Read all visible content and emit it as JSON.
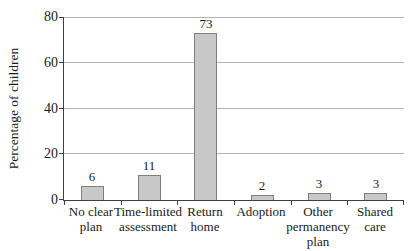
{
  "chart_data": {
    "type": "bar",
    "title": "",
    "xlabel": "",
    "ylabel": "Percentage of children",
    "categories": [
      "No clear\nplan",
      "Time-limited\nassessment",
      "Return\nhome",
      "Adoption",
      "Other\npermanency\nplan",
      "Shared\ncare"
    ],
    "values": [
      6,
      11,
      73,
      2,
      3,
      3
    ],
    "value_labels": [
      "6",
      "11",
      "73",
      "2",
      "3",
      "3"
    ],
    "ylim": [
      0,
      80
    ],
    "yticks": [
      0,
      20,
      40,
      60,
      80
    ],
    "grid": true,
    "legend_position": "none",
    "colors": {
      "bar_fill": "#c8c8c8",
      "bar_border": "#7f7f7f",
      "gridline": "#b3b3b3",
      "axis": "#404040",
      "text": "#1a1a1a",
      "background": "#ffffff"
    }
  }
}
